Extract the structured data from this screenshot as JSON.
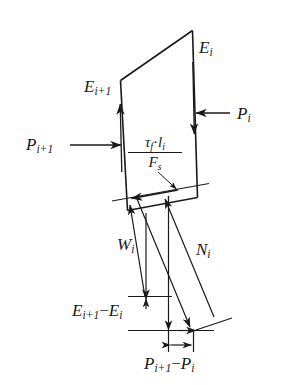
{
  "figure": {
    "background_color": "#ffffff",
    "line_color": "#1a1a1a",
    "labels": {
      "e_i": {
        "base": "E",
        "sub": "i"
      },
      "e_i_plus_1": {
        "base": "E",
        "sub": "i+1"
      },
      "p_i": {
        "base": "P",
        "sub": "i"
      },
      "p_i_plus_1": {
        "base": "P",
        "sub": "i+1"
      },
      "w_i": {
        "base": "W",
        "sub": "i"
      },
      "n_i": {
        "base": "N",
        "sub": "i"
      },
      "shear_force": {
        "numerator_tau": "τ",
        "numerator_tau_sub": "f",
        "numerator_dot": "·",
        "numerator_l": "l",
        "numerator_l_sub": "i",
        "denominator": "F",
        "denominator_sub": "s"
      },
      "delta_e": {
        "first": "E",
        "first_sub": "i+1",
        "operator": "−",
        "second": "E",
        "second_sub": "i"
      },
      "delta_p": {
        "first": "P",
        "first_sub": "i+1",
        "operator": "−",
        "second": "P",
        "second_sub": "i"
      }
    }
  }
}
